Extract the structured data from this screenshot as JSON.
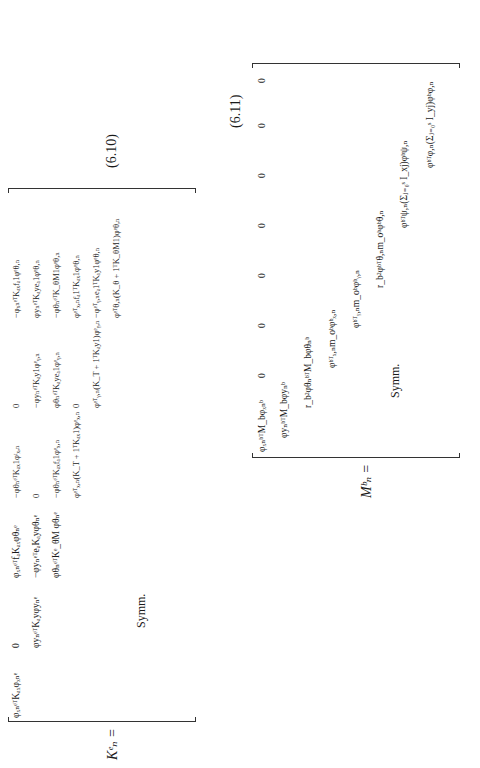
{
  "equation_6_10": {
    "lhs": "Kᵉₙ =",
    "number": "(6.10)",
    "symm": "Symm.",
    "rows": [
      [
        "φₓₙᵉᵀKₐₓφₓₙᵉ",
        "0",
        "φₓₙᵉᵀfₐKₐₓφθₙᵉ",
        "−φθₙᵉᵀKₐₓ1φᵗₓ,ₙ",
        "0",
        "−φₓₙᵉᵀKₐₓfₐ1φᵉθ,ₙ",
        "−φₓₙᵉᵀKₐₓhₐφᵉφ,ₙ"
      ],
      [
        "",
        "φyₙᵉᵀKₐyφyₙᵉ",
        "−φyₙᵉᵀeₐKₐyφθₙᵉ",
        "0",
        "−φyₙᵉᵀKₐy1φᵉᵧ,ₙ",
        "φyₙᵉᵀKₐyeₐ1φᵉθ,ₙ",
        "−φyₙᵉᵀKₐyhₐφᵉψ,ₙ"
      ],
      [
        "",
        "",
        "φθₙᵉᵀKᵉ_θM φθₙᵉ",
        "−φθₙᵉᵀKₐₓfₐ1φᵉₓ,ₙ",
        "φθₙᵉᵀKₐyeₐ1φᵉᵧ,ₙ",
        "−φθₙᵉᵀK_θM1φᵉθ,ₙ",
        "φθₙᵉᵀeₐKₐyhₐφᵉψ,ₙ"
      ],
      [
        "",
        "",
        "",
        "φᵉᵀₓ,ₙ(K_T + 1ᵀKₐₓ1)φᵉₓ,ₙ",
        "0",
        "φᵉᵀₓ,ₙfₐ1ᵀKₐₓ1φᵉθ,ₙ",
        "φᵉᵀₓ,ₙ1ᵀKₐₓhₐφᵉφ,ₙ"
      ],
      [
        "",
        "",
        "",
        "",
        "φᵉᵀᵧ,ₙ(K_T + 1ᵀKₐy1)φᵉᵧ,ₙ",
        "−φᵉᵀᵧ,ₙeₐ1ᵀKₐy1φᵉθ,ₙ",
        "φᵉᵀᵧ,ₙ1ᵀKₐyhₐφᵉψ,ₙ"
      ],
      [
        "",
        "",
        "",
        "",
        "",
        "φᵉᵀθ,ₙ(K_θ + 1ᵀK_θM1)φᵉθ,ₙ",
        "−φᵉᵀθ,ₙeₐ1ᵀKₐyhₐφᵉψ,ₙ"
      ],
      [
        "",
        "",
        "",
        "",
        "",
        "",
        "φᵉᵀψ,ₙ(K_ψ + hₐᵀKₐyhₐ)φᵉψ,ₙ"
      ],
      [
        "",
        "",
        "",
        "",
        "",
        "",
        "φᵉᵀφ,ₙ(K_φ + hₐᵀKₐₓhₐ)φᵉφ,ₙ"
      ]
    ]
  },
  "equation_6_11": {
    "lhs": "Mᵇₙ =",
    "number": "(6.11)",
    "symm": "Symm.",
    "rows": [
      [
        "φₓₙᵇᵀM_bφₓₙᵇ",
        "0",
        "0",
        "0",
        "0",
        "0",
        "0",
        "0"
      ],
      [
        "",
        "φyₙᵇᵀM_bφyₙᵇ",
        "0",
        "0",
        "0",
        "0",
        "0",
        "0"
      ],
      [
        "",
        "",
        "r_b²φθₙᵇᵀM_bφθₙᵇ",
        "0",
        "0",
        "0",
        "0",
        "0"
      ],
      [
        "",
        "",
        "",
        "φᵇᵀₓ,ₙm_oᵇφᵇₓ,ₙ",
        "0",
        "0",
        "0",
        "0"
      ],
      [
        "",
        "",
        "",
        "",
        "φᵇᵀᵧ,ₙm_oᵇφᵇᵧ,ₙ",
        "0",
        "0",
        "0"
      ],
      [
        "",
        "",
        "",
        "",
        "",
        "r_b²φᵇᵀθ,ₙm_oᵇφᵇθ,ₙ",
        "0",
        "0"
      ],
      [
        "",
        "",
        "",
        "",
        "",
        "",
        "φᵇᵀψ,ₙ(Σⱼ₌₀ˢ I_xj)φᵇψ,ₙ",
        "0"
      ],
      [
        "",
        "",
        "",
        "",
        "",
        "",
        "",
        "φᵇᵀφ,ₙ(Σⱼ₌₀ˢ I_yj)φᵇφ,ₙ"
      ]
    ]
  }
}
